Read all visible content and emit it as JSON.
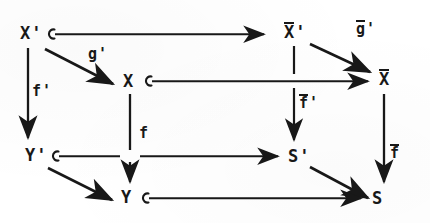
{
  "diagram": {
    "type": "commutative-diagram",
    "background_color": "#ffffff",
    "ink_color": "#181818",
    "nodes": [
      {
        "id": "Xp",
        "label": "X",
        "overline": false,
        "prime": true,
        "x": 20,
        "y": 25,
        "name": "node-x-prime"
      },
      {
        "id": "Xbarp",
        "label": "X",
        "overline": true,
        "prime": true,
        "x": 284,
        "y": 23,
        "name": "node-xbar-prime"
      },
      {
        "id": "X",
        "label": "X",
        "overline": false,
        "prime": false,
        "x": 123,
        "y": 73,
        "name": "node-x"
      },
      {
        "id": "Xbar",
        "label": "X",
        "overline": true,
        "prime": false,
        "x": 379,
        "y": 70,
        "name": "node-xbar"
      },
      {
        "id": "Yp",
        "label": "Y",
        "overline": false,
        "prime": true,
        "x": 25,
        "y": 147,
        "name": "node-y-prime"
      },
      {
        "id": "Sp",
        "label": "S",
        "overline": false,
        "prime": true,
        "x": 288,
        "y": 148,
        "name": "node-s-prime"
      },
      {
        "id": "Y",
        "label": "Y",
        "overline": false,
        "prime": false,
        "x": 121,
        "y": 189,
        "name": "node-y"
      },
      {
        "id": "S",
        "label": "S",
        "overline": false,
        "prime": false,
        "x": 372,
        "y": 190,
        "name": "node-s"
      }
    ],
    "edge_labels": [
      {
        "id": "gp",
        "label": "g",
        "overline": false,
        "prime": true,
        "x": 88,
        "y": 47,
        "name": "edge-label-g-prime"
      },
      {
        "id": "gbarp",
        "label": "g",
        "overline": true,
        "prime": true,
        "x": 356,
        "y": 21,
        "name": "edge-label-gbar-prime"
      },
      {
        "id": "fp",
        "label": "f",
        "overline": false,
        "prime": true,
        "x": 32,
        "y": 84,
        "name": "edge-label-f-prime"
      },
      {
        "id": "fbarp",
        "label": "f",
        "overline": true,
        "prime": true,
        "x": 299,
        "y": 95,
        "name": "edge-label-fbar-prime"
      },
      {
        "id": "f",
        "label": "f",
        "overline": false,
        "prime": false,
        "x": 139,
        "y": 126,
        "name": "edge-label-f"
      },
      {
        "id": "fbar",
        "label": "f",
        "overline": true,
        "prime": false,
        "x": 390,
        "y": 145,
        "name": "edge-label-fbar"
      }
    ],
    "edges": [
      {
        "id": "e1",
        "from": "Xp",
        "to": "Xbarp",
        "style": "hooked-arrow",
        "name": "edge-xprime-to-xbarprime"
      },
      {
        "id": "e2",
        "from": "Xp",
        "to": "X",
        "style": "plain-arrow",
        "name": "edge-xprime-to-x"
      },
      {
        "id": "e3",
        "from": "Xp",
        "to": "Yp",
        "style": "plain-arrow",
        "name": "edge-xprime-to-yprime"
      },
      {
        "id": "e4",
        "from": "X",
        "to": "Xbar",
        "style": "hooked-arrow",
        "name": "edge-x-to-xbar"
      },
      {
        "id": "e5",
        "from": "Xbarp",
        "to": "Xbar",
        "style": "plain-arrow",
        "name": "edge-xbarprime-to-xbar"
      },
      {
        "id": "e6",
        "from": "Xbarp",
        "to": "Sp",
        "style": "plain-arrow",
        "name": "edge-xbarprime-to-sprime"
      },
      {
        "id": "e7",
        "from": "X",
        "to": "Y",
        "style": "plain-arrow",
        "name": "edge-x-to-y"
      },
      {
        "id": "e8",
        "from": "Yp",
        "to": "Sp",
        "style": "hooked-arrow",
        "name": "edge-yprime-to-sprime"
      },
      {
        "id": "e9",
        "from": "Yp",
        "to": "Y",
        "style": "plain-arrow",
        "name": "edge-yprime-to-y"
      },
      {
        "id": "e10",
        "from": "Xbar",
        "to": "S",
        "style": "plain-arrow",
        "name": "edge-xbar-to-s"
      },
      {
        "id": "e11",
        "from": "Sp",
        "to": "S",
        "style": "plain-arrow",
        "name": "edge-sprime-to-s"
      },
      {
        "id": "e12",
        "from": "Y",
        "to": "S",
        "style": "hooked-arrow",
        "name": "edge-y-to-s"
      }
    ]
  }
}
